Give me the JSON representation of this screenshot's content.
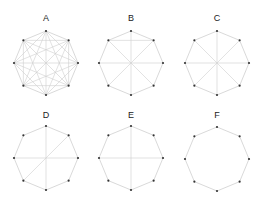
{
  "figure": {
    "width": 264,
    "height": 202,
    "radius": 32,
    "vertex_count": 8,
    "vertex_radius": 1.1,
    "colors": {
      "background": "#ffffff",
      "edge": "#cfcfcf",
      "vertex": "#333333",
      "label": "#222222"
    },
    "panels": [
      {
        "label": "A",
        "cx": 46,
        "cy": 63,
        "label_y": 21,
        "cycle": true,
        "chords": "complete"
      },
      {
        "label": "B",
        "cx": 131,
        "cy": 63,
        "label_y": 21,
        "cycle": true,
        "chords": [
          [
            0,
            4
          ],
          [
            2,
            6
          ],
          [
            1,
            5
          ],
          [
            3,
            7
          ],
          [
            7,
            1
          ]
        ]
      },
      {
        "label": "C",
        "cx": 217,
        "cy": 63,
        "label_y": 21,
        "cycle": true,
        "chords": [
          [
            0,
            4
          ],
          [
            2,
            6
          ],
          [
            1,
            5
          ],
          [
            3,
            7
          ]
        ]
      },
      {
        "label": "D",
        "cx": 46,
        "cy": 158,
        "label_y": 118,
        "cycle": true,
        "chords": [
          [
            0,
            4
          ],
          [
            2,
            6
          ],
          [
            1,
            5
          ]
        ]
      },
      {
        "label": "E",
        "cx": 131,
        "cy": 158,
        "label_y": 118,
        "cycle": true,
        "chords": [
          [
            0,
            4
          ],
          [
            2,
            6
          ]
        ]
      },
      {
        "label": "F",
        "cx": 217,
        "cy": 159,
        "label_y": 118,
        "cycle": true,
        "chords": []
      }
    ]
  }
}
